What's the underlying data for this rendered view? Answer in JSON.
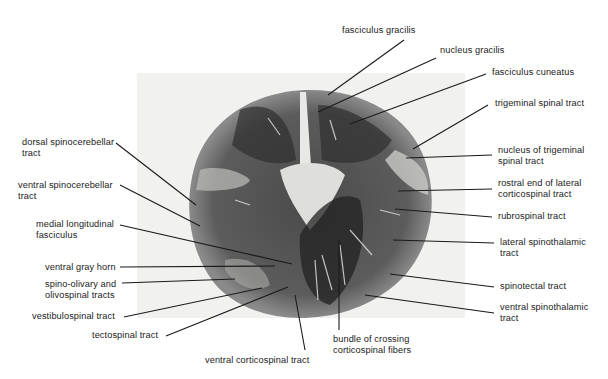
{
  "figure": {
    "colors": {
      "background": "#ffffff",
      "panel": "#f1f1f0",
      "tissue_dark": "#3a3a3a",
      "tissue_mid": "#6e6e6e",
      "tissue_light": "#d6d6d4",
      "leader": "#1a1a1a"
    }
  },
  "labels": {
    "fasciculus_gracilis": "fasciculus gracilis",
    "nucleus_gracilis": "nucleus gracilis",
    "fasciculus_cuneatus": "fasciculus cuneatus",
    "trigeminal_spinal_tract": "trigeminal spinal tract",
    "nucleus_trigeminal": "nucleus of trigeminal\nspinal tract",
    "rostral_end_lcst": "rostral end of lateral\ncorticospinal tract",
    "rubrospinal": "rubrospinal tract",
    "lateral_spinothalamic": "lateral spinothalamic\ntract",
    "spinotectal": "spinotectal tract",
    "ventral_spinothalamic": "ventral spinothalamic\ntract",
    "bundle_crossing": "bundle of crossing\ncorticospinal fibers",
    "ventral_corticospinal": "ventral corticospinal tract",
    "tectospinal": "tectospinal tract",
    "vestibulospinal": "vestibulospinal tract",
    "spino_olivary": "spino-olivary and\nolivospinal tracts",
    "ventral_gray_horn": "ventral gray horn",
    "medial_longitudinal": "medial longitudinal\nfasciculus",
    "ventral_spinocerebellar": "ventral spinocerebellar\ntract",
    "dorsal_spinocerebellar": "dorsal spinocerebellar\ntract"
  }
}
